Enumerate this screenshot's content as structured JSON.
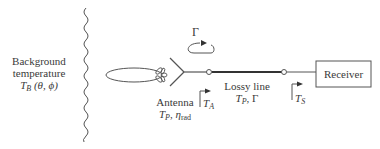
{
  "background": {
    "line1": "Background",
    "line2": "temperature",
    "symbol": "T",
    "subscript": "B",
    "args": "(θ, ϕ)"
  },
  "reflection": {
    "symbol": "Γ"
  },
  "antenna": {
    "label": "Antenna",
    "symbol": "T",
    "subscript": "P",
    "eta": "η",
    "eta_subscript": "rad"
  },
  "lossy_line": {
    "label": "Lossy line",
    "symbol": "T",
    "subscript": "P",
    "gamma": "Γ"
  },
  "ref_planes": [
    {
      "symbol": "T",
      "subscript": "A"
    },
    {
      "symbol": "T",
      "subscript": "S"
    }
  ],
  "receiver": {
    "label": "Receiver"
  },
  "colors": {
    "stroke": "#555555",
    "text": "#3a3a3a"
  }
}
